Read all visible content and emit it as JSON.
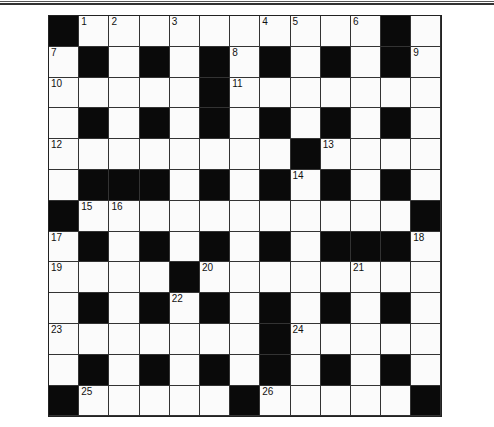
{
  "puzzle": {
    "rows": 13,
    "cols": 13,
    "colors": {
      "block": "#0a0a0a",
      "cell": "#fbfbfb",
      "line": "#333333"
    },
    "grid": [
      "#..........#.",
      ".#.#.#.#.#.#.",
      ".....#.......",
      ".#.#.#.#.#.#.",
      "........#....",
      ".###.#.#.#.#.",
      "#...........#",
      ".#.#.#.#.###.",
      "....#........",
      ".#.#.#.#.#.#.",
      ".......#.....",
      ".#.#.#.#.#.#.",
      "#.....#.....#"
    ],
    "numbers": [
      {
        "r": 0,
        "c": 1,
        "n": "1"
      },
      {
        "r": 0,
        "c": 2,
        "n": "2"
      },
      {
        "r": 0,
        "c": 4,
        "n": "3"
      },
      {
        "r": 0,
        "c": 7,
        "n": "4"
      },
      {
        "r": 0,
        "c": 8,
        "n": "5"
      },
      {
        "r": 0,
        "c": 10,
        "n": "6"
      },
      {
        "r": 1,
        "c": 0,
        "n": "7"
      },
      {
        "r": 1,
        "c": 6,
        "n": "8"
      },
      {
        "r": 1,
        "c": 12,
        "n": "9"
      },
      {
        "r": 2,
        "c": 0,
        "n": "10"
      },
      {
        "r": 2,
        "c": 6,
        "n": "11"
      },
      {
        "r": 4,
        "c": 0,
        "n": "12"
      },
      {
        "r": 4,
        "c": 9,
        "n": "13"
      },
      {
        "r": 5,
        "c": 8,
        "n": "14"
      },
      {
        "r": 6,
        "c": 1,
        "n": "15"
      },
      {
        "r": 6,
        "c": 2,
        "n": "16"
      },
      {
        "r": 7,
        "c": 0,
        "n": "17"
      },
      {
        "r": 7,
        "c": 12,
        "n": "18"
      },
      {
        "r": 8,
        "c": 0,
        "n": "19"
      },
      {
        "r": 8,
        "c": 5,
        "n": "20"
      },
      {
        "r": 8,
        "c": 10,
        "n": "21"
      },
      {
        "r": 9,
        "c": 4,
        "n": "22"
      },
      {
        "r": 10,
        "c": 0,
        "n": "23"
      },
      {
        "r": 10,
        "c": 8,
        "n": "24"
      },
      {
        "r": 12,
        "c": 1,
        "n": "25"
      },
      {
        "r": 12,
        "c": 7,
        "n": "26"
      }
    ]
  }
}
